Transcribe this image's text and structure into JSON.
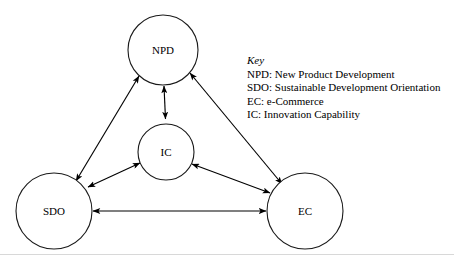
{
  "figure": {
    "background_color": "#ffffff",
    "line_color": "#000000",
    "node_stroke_color": "#1a1a1a",
    "rule_color": "#d8d8d8"
  },
  "nodes": [
    {
      "id": "npd",
      "label": "NPD",
      "cx": 163,
      "cy": 50,
      "r": 35
    },
    {
      "id": "ic",
      "label": "IC",
      "cx": 166,
      "cy": 152,
      "r": 28
    },
    {
      "id": "sdo",
      "label": "SDO",
      "cx": 54,
      "cy": 211,
      "r": 38
    },
    {
      "id": "ec",
      "label": "EC",
      "cx": 305,
      "cy": 211,
      "r": 38
    }
  ],
  "links": [
    {
      "id": "npd-ic",
      "from": "NPD",
      "to": "IC",
      "arrows": "both"
    },
    {
      "id": "npd-sdo",
      "from": "NPD",
      "to": "SDO",
      "arrows": "both"
    },
    {
      "id": "npd-ec",
      "from": "NPD",
      "to": "EC",
      "arrows": "both"
    },
    {
      "id": "ic-sdo",
      "from": "IC",
      "to": "SDO",
      "arrows": "both"
    },
    {
      "id": "ic-ec",
      "from": "IC",
      "to": "EC",
      "arrows": "both"
    },
    {
      "id": "sdo-ec",
      "from": "SDO",
      "to": "EC",
      "arrows": "both"
    }
  ],
  "key": {
    "title": "Key",
    "entries": [
      "NPD: New Product Development",
      "SDO: Sustainable Development Orientation",
      "EC: e-Commerce",
      "IC: Innovation Capability"
    ]
  }
}
